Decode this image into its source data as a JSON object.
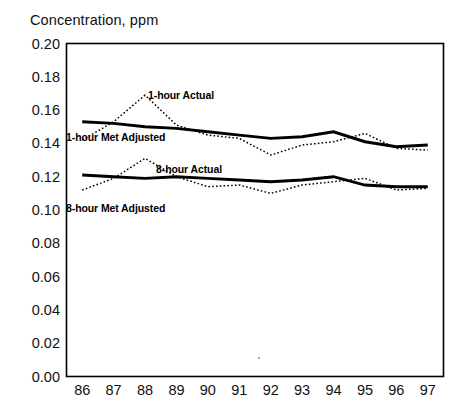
{
  "chart_data": {
    "type": "line",
    "title": "Concentration, ppm",
    "xlabel": "",
    "ylabel": "Concentration, ppm",
    "grid": false,
    "legend_position": "inline-annotations",
    "x": [
      "86",
      "87",
      "88",
      "89",
      "90",
      "91",
      "92",
      "93",
      "94",
      "95",
      "96",
      "97"
    ],
    "categories": [
      "86",
      "87",
      "88",
      "89",
      "90",
      "91",
      "92",
      "93",
      "94",
      "95",
      "96",
      "97"
    ],
    "ylim": [
      0.0,
      0.2
    ],
    "yticks": [
      "0.00",
      "0.02",
      "0.04",
      "0.06",
      "0.08",
      "0.10",
      "0.12",
      "0.14",
      "0.16",
      "0.18",
      "0.20"
    ],
    "ytick_values": [
      0.0,
      0.02,
      0.04,
      0.06,
      0.08,
      0.1,
      0.12,
      0.14,
      0.16,
      0.18,
      0.2
    ],
    "series": [
      {
        "name": "1-hour Actual",
        "style": "dotted",
        "values": [
          0.142,
          0.153,
          0.169,
          0.151,
          0.145,
          0.143,
          0.133,
          0.139,
          0.141,
          0.146,
          0.137,
          0.136
        ]
      },
      {
        "name": "1-hour Met Adjusted",
        "style": "solid",
        "values": [
          0.153,
          0.152,
          0.15,
          0.149,
          0.147,
          0.145,
          0.143,
          0.144,
          0.147,
          0.141,
          0.138,
          0.139
        ]
      },
      {
        "name": "8-hour Actual",
        "style": "dotted",
        "values": [
          0.112,
          0.119,
          0.131,
          0.12,
          0.114,
          0.115,
          0.11,
          0.115,
          0.117,
          0.119,
          0.112,
          0.113
        ]
      },
      {
        "name": "8-hour Met Adjusted",
        "style": "solid",
        "values": [
          0.121,
          0.12,
          0.119,
          0.12,
          0.119,
          0.118,
          0.117,
          0.118,
          0.12,
          0.115,
          0.114,
          0.114
        ]
      }
    ],
    "annotations": [
      {
        "text": "1-hour Actual",
        "x": 148,
        "y": 89
      },
      {
        "text": "1-hour Met Adjusted",
        "x": 66,
        "y": 131
      },
      {
        "text": "8-hour Actual",
        "x": 156,
        "y": 163
      },
      {
        "text": "8-hour Met Adjusted",
        "x": 66,
        "y": 202
      }
    ],
    "colors": {
      "line": "#000000",
      "axis": "#000000",
      "background": "#ffffff"
    }
  }
}
